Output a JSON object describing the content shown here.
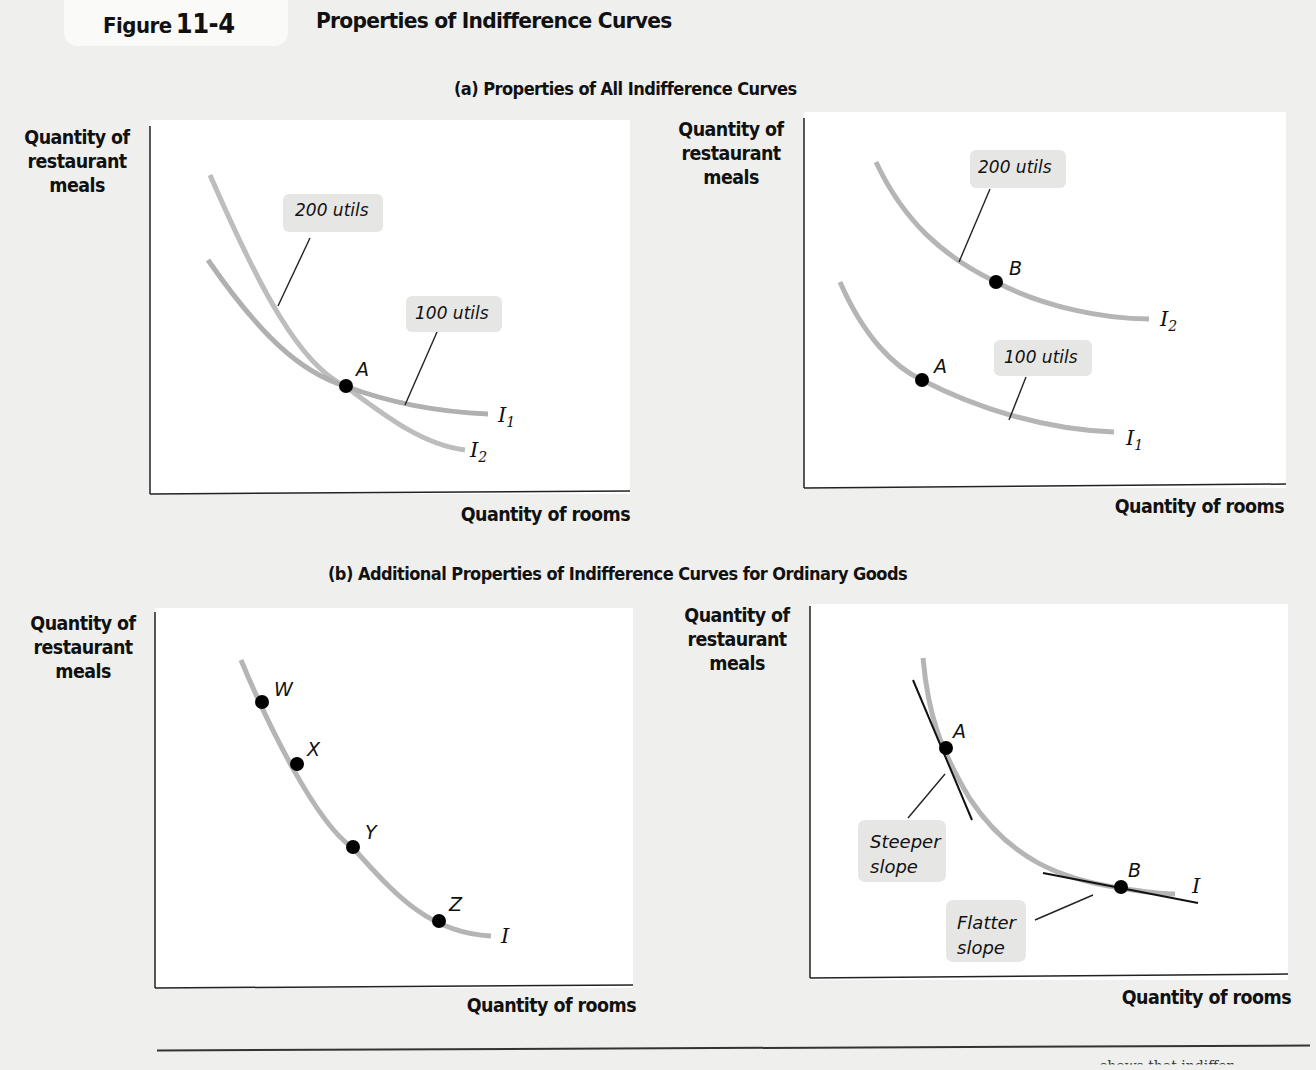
{
  "figure": {
    "label": "Figure",
    "number": "11-4",
    "title": "Properties of Indifference Curves"
  },
  "sections": {
    "a_title": "(a) Properties of All Indifference Curves",
    "b_title": "(b) Additional Properties of Indifference Curves for Ordinary Goods"
  },
  "axes": {
    "y_label_line1": "Quantity of",
    "y_label_line2": "restaurant",
    "y_label_line3": "meals",
    "x_label": "Quantity of rooms"
  },
  "panels": {
    "a_left": {
      "callout_200": "200 utils",
      "callout_100": "100 utils",
      "point_A": "A",
      "curve_I1": "I",
      "curve_I1_sub": "1",
      "curve_I2": "I",
      "curve_I2_sub": "2"
    },
    "a_right": {
      "callout_200": "200 utils",
      "callout_100": "100 utils",
      "point_A": "A",
      "point_B": "B",
      "curve_I1": "I",
      "curve_I1_sub": "1",
      "curve_I2": "I",
      "curve_I2_sub": "2"
    },
    "b_left": {
      "point_W": "W",
      "point_X": "X",
      "point_Y": "Y",
      "point_Z": "Z",
      "curve_I": "I"
    },
    "b_right": {
      "point_A": "A",
      "point_B": "B",
      "curve_I": "I",
      "callout_steeper_1": "Steeper",
      "callout_steeper_2": "slope",
      "callout_flatter_1": "Flatter",
      "callout_flatter_2": "slope"
    }
  },
  "footer": {
    "cut_text": "shows that indiffer-"
  },
  "colors": {
    "curve": "#b5b5b5",
    "callout_bg": "#e6e6e4",
    "point": "#000000",
    "page_bg": "#efefed"
  }
}
